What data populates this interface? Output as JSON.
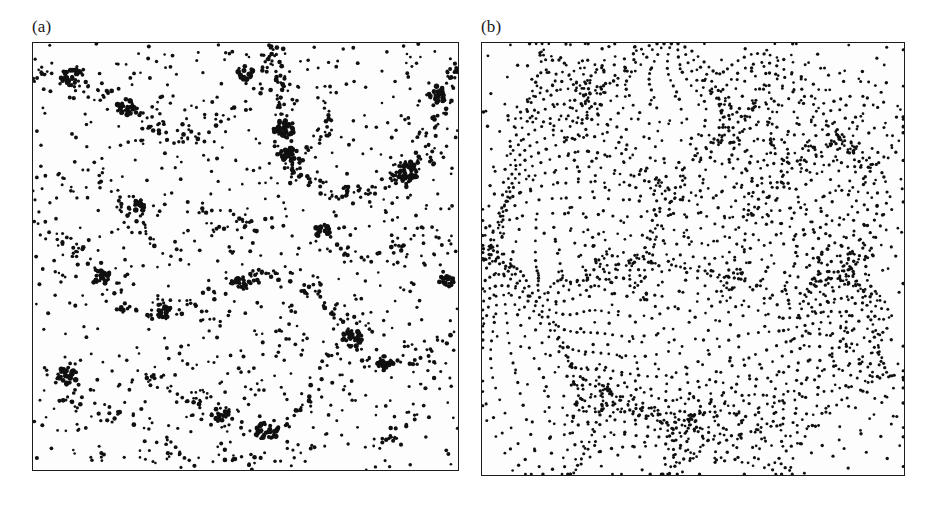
{
  "figure": {
    "background_color": "#ffffff",
    "ink_color": "#101010",
    "frame_color": "#1c1c1c",
    "panels": [
      {
        "id": "a",
        "label": "(a)",
        "caption_text": "(a)",
        "frame": {
          "x": 32,
          "y": 50,
          "width": 427,
          "height": 429
        },
        "description": "clustered point distribution with filaments and voids"
      },
      {
        "id": "b",
        "label": "(b)",
        "caption_text": "(b)",
        "frame": {
          "x": 481,
          "y": 50,
          "width": 424,
          "height": 434
        },
        "description": "deformed particle lattice showing caustic filaments"
      }
    ]
  },
  "chart_data": [
    {
      "type": "scatter",
      "id": "panel-a",
      "title": "(a)",
      "xlabel": "",
      "ylabel": "",
      "xlim": [
        0,
        1
      ],
      "ylim": [
        0,
        1
      ],
      "grid": false,
      "legend": "none",
      "marker": "filled-circle",
      "marker_color": "#101010",
      "marker_size_px": 3.1,
      "n_points": 1850,
      "point_model": "clustered",
      "clustering": {
        "smooth_background_fraction": 0.34,
        "filament_fraction": 0.44,
        "halo_fraction": 0.22,
        "seed": 20240517,
        "filament_thickness": 0.012,
        "halo_core_radius": 0.009
      },
      "filaments": [
        {
          "points": [
            [
              0.02,
              0.93
            ],
            [
              0.1,
              0.9
            ],
            [
              0.17,
              0.88
            ],
            [
              0.24,
              0.83
            ],
            [
              0.3,
              0.8
            ]
          ],
          "weight": 46
        },
        {
          "points": [
            [
              0.3,
              0.8
            ],
            [
              0.37,
              0.78
            ],
            [
              0.44,
              0.8
            ],
            [
              0.5,
              0.86
            ],
            [
              0.55,
              0.93
            ],
            [
              0.58,
              0.99
            ]
          ],
          "weight": 40
        },
        {
          "points": [
            [
              0.55,
              0.99
            ],
            [
              0.57,
              0.92
            ],
            [
              0.59,
              0.84
            ],
            [
              0.6,
              0.76
            ],
            [
              0.62,
              0.7
            ]
          ],
          "weight": 58
        },
        {
          "points": [
            [
              0.62,
              0.7
            ],
            [
              0.69,
              0.66
            ],
            [
              0.76,
              0.65
            ],
            [
              0.83,
              0.67
            ],
            [
              0.9,
              0.71
            ],
            [
              0.97,
              0.74
            ]
          ],
          "weight": 60
        },
        {
          "points": [
            [
              0.9,
              0.71
            ],
            [
              0.94,
              0.8
            ],
            [
              0.97,
              0.88
            ],
            [
              0.99,
              0.95
            ]
          ],
          "weight": 34
        },
        {
          "points": [
            [
              0.0,
              0.58
            ],
            [
              0.07,
              0.54
            ],
            [
              0.13,
              0.49
            ],
            [
              0.18,
              0.44
            ],
            [
              0.22,
              0.38
            ]
          ],
          "weight": 40
        },
        {
          "points": [
            [
              0.22,
              0.38
            ],
            [
              0.3,
              0.37
            ],
            [
              0.38,
              0.39
            ],
            [
              0.45,
              0.43
            ],
            [
              0.52,
              0.46
            ]
          ],
          "weight": 34
        },
        {
          "points": [
            [
              0.52,
              0.46
            ],
            [
              0.6,
              0.44
            ],
            [
              0.68,
              0.4
            ],
            [
              0.74,
              0.34
            ],
            [
              0.78,
              0.27
            ]
          ],
          "weight": 44
        },
        {
          "points": [
            [
              0.78,
              0.27
            ],
            [
              0.85,
              0.25
            ],
            [
              0.92,
              0.27
            ],
            [
              0.98,
              0.32
            ]
          ],
          "weight": 30
        },
        {
          "points": [
            [
              0.26,
              0.22
            ],
            [
              0.34,
              0.18
            ],
            [
              0.42,
              0.14
            ],
            [
              0.5,
              0.11
            ],
            [
              0.58,
              0.1
            ]
          ],
          "weight": 38
        },
        {
          "points": [
            [
              0.58,
              0.1
            ],
            [
              0.64,
              0.15
            ],
            [
              0.68,
              0.21
            ],
            [
              0.7,
              0.28
            ]
          ],
          "weight": 26
        },
        {
          "points": [
            [
              0.05,
              0.18
            ],
            [
              0.12,
              0.14
            ],
            [
              0.2,
              0.12
            ],
            [
              0.27,
              0.13
            ]
          ],
          "weight": 24
        },
        {
          "points": [
            [
              0.4,
              0.62
            ],
            [
              0.46,
              0.58
            ],
            [
              0.52,
              0.57
            ],
            [
              0.58,
              0.58
            ]
          ],
          "weight": 22
        },
        {
          "points": [
            [
              0.14,
              0.7
            ],
            [
              0.2,
              0.64
            ],
            [
              0.25,
              0.58
            ],
            [
              0.28,
              0.52
            ]
          ],
          "weight": 26
        },
        {
          "points": [
            [
              0.72,
              0.52
            ],
            [
              0.79,
              0.5
            ],
            [
              0.86,
              0.51
            ],
            [
              0.93,
              0.55
            ]
          ],
          "weight": 24
        },
        {
          "points": [
            [
              0.33,
              0.05
            ],
            [
              0.4,
              0.03
            ],
            [
              0.48,
              0.02
            ],
            [
              0.56,
              0.03
            ]
          ],
          "weight": 20
        },
        {
          "points": [
            [
              0.8,
              0.06
            ],
            [
              0.86,
              0.1
            ],
            [
              0.91,
              0.15
            ],
            [
              0.95,
              0.21
            ]
          ],
          "weight": 20
        },
        {
          "points": [
            [
              0.6,
              0.7
            ],
            [
              0.66,
              0.76
            ],
            [
              0.7,
              0.83
            ],
            [
              0.72,
              0.9
            ]
          ],
          "weight": 22
        }
      ],
      "halos": [
        {
          "x": 0.09,
          "y": 0.92,
          "n": 22,
          "r": 0.022
        },
        {
          "x": 0.22,
          "y": 0.85,
          "n": 26,
          "r": 0.02
        },
        {
          "x": 0.59,
          "y": 0.8,
          "n": 40,
          "r": 0.022
        },
        {
          "x": 0.6,
          "y": 0.74,
          "n": 34,
          "r": 0.017
        },
        {
          "x": 0.88,
          "y": 0.7,
          "n": 44,
          "r": 0.024
        },
        {
          "x": 0.95,
          "y": 0.88,
          "n": 28,
          "r": 0.02
        },
        {
          "x": 0.5,
          "y": 0.93,
          "n": 20,
          "r": 0.017
        },
        {
          "x": 0.16,
          "y": 0.45,
          "n": 22,
          "r": 0.018
        },
        {
          "x": 0.08,
          "y": 0.22,
          "n": 26,
          "r": 0.02
        },
        {
          "x": 0.49,
          "y": 0.44,
          "n": 24,
          "r": 0.018
        },
        {
          "x": 0.75,
          "y": 0.31,
          "n": 30,
          "r": 0.021
        },
        {
          "x": 0.83,
          "y": 0.25,
          "n": 22,
          "r": 0.017
        },
        {
          "x": 0.55,
          "y": 0.09,
          "n": 34,
          "r": 0.022
        },
        {
          "x": 0.44,
          "y": 0.13,
          "n": 20,
          "r": 0.017
        },
        {
          "x": 0.31,
          "y": 0.37,
          "n": 18,
          "r": 0.015
        },
        {
          "x": 0.97,
          "y": 0.44,
          "n": 20,
          "r": 0.017
        },
        {
          "x": 0.68,
          "y": 0.56,
          "n": 18,
          "r": 0.015
        },
        {
          "x": 0.25,
          "y": 0.62,
          "n": 16,
          "r": 0.014
        }
      ]
    },
    {
      "type": "scatter",
      "id": "panel-b",
      "title": "(b)",
      "xlabel": "",
      "ylabel": "",
      "xlim": [
        0,
        1
      ],
      "ylim": [
        0,
        1
      ],
      "grid": false,
      "legend": "none",
      "marker": "filled-circle",
      "marker_color": "#101010",
      "marker_size_px": 2.9,
      "point_model": "displaced-lattice",
      "lattice": {
        "nx": 53,
        "ny": 54,
        "spacing_px": 8.0,
        "seed": 77310,
        "jitter": 0.06
      },
      "displacement": {
        "model": "zeldovich-multimode",
        "amplitude": 0.055,
        "modes": [
          {
            "kx": 1,
            "ky": 1,
            "phase": 0.3,
            "amp": 1.0
          },
          {
            "kx": 2,
            "ky": 1,
            "phase": 1.9,
            "amp": 0.72
          },
          {
            "kx": 1,
            "ky": 2,
            "phase": 2.7,
            "amp": 0.66
          },
          {
            "kx": 3,
            "ky": 2,
            "phase": 0.85,
            "amp": 0.44
          },
          {
            "kx": 2,
            "ky": 3,
            "phase": 4.1,
            "amp": 0.4
          },
          {
            "kx": 3,
            "ky": 3,
            "phase": 5.2,
            "amp": 0.3
          },
          {
            "kx": 4,
            "ky": 1,
            "phase": 1.15,
            "amp": 0.24
          },
          {
            "kx": 1,
            "ky": 4,
            "phase": 3.35,
            "amp": 0.22
          }
        ]
      },
      "attractors": [
        {
          "x": 0.09,
          "y": 0.93,
          "strength": 0.052,
          "radius": 0.13
        },
        {
          "x": 0.26,
          "y": 0.86,
          "strength": 0.046,
          "radius": 0.12
        },
        {
          "x": 0.6,
          "y": 0.82,
          "strength": 0.06,
          "radius": 0.14
        },
        {
          "x": 0.86,
          "y": 0.78,
          "strength": 0.062,
          "radius": 0.15
        },
        {
          "x": 0.97,
          "y": 0.93,
          "strength": 0.04,
          "radius": 0.1
        },
        {
          "x": 0.05,
          "y": 0.52,
          "strength": 0.048,
          "radius": 0.12
        },
        {
          "x": 0.33,
          "y": 0.48,
          "strength": 0.044,
          "radius": 0.13
        },
        {
          "x": 0.58,
          "y": 0.42,
          "strength": 0.05,
          "radius": 0.13
        },
        {
          "x": 0.82,
          "y": 0.5,
          "strength": 0.042,
          "radius": 0.12
        },
        {
          "x": 0.2,
          "y": 0.18,
          "strength": 0.046,
          "radius": 0.12
        },
        {
          "x": 0.49,
          "y": 0.14,
          "strength": 0.056,
          "radius": 0.14
        },
        {
          "x": 0.74,
          "y": 0.08,
          "strength": 0.044,
          "radius": 0.12
        },
        {
          "x": 0.93,
          "y": 0.22,
          "strength": 0.04,
          "radius": 0.11
        },
        {
          "x": 0.42,
          "y": 0.66,
          "strength": 0.038,
          "radius": 0.11
        },
        {
          "x": 0.68,
          "y": 0.62,
          "strength": 0.036,
          "radius": 0.1
        }
      ]
    }
  ]
}
